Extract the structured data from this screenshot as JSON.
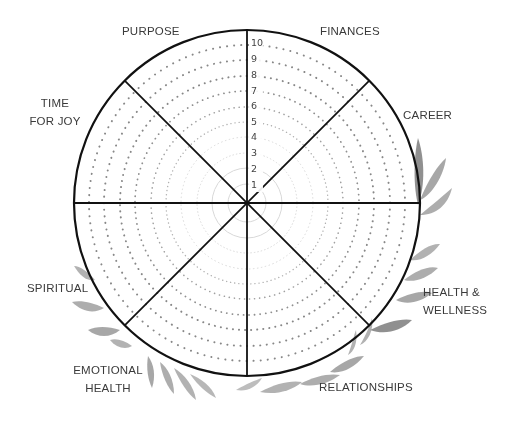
{
  "scale": {
    "min": 1,
    "max": 10,
    "ticks": [
      "1",
      "2",
      "3",
      "4",
      "5",
      "6",
      "7",
      "8",
      "9",
      "10"
    ]
  },
  "categories": [
    {
      "id": "purpose",
      "lines": [
        "PURPOSE"
      ]
    },
    {
      "id": "finances",
      "lines": [
        "FINANCES"
      ]
    },
    {
      "id": "career",
      "lines": [
        "CAREER"
      ]
    },
    {
      "id": "health-wellness",
      "lines": [
        "HEALTH &",
        "WELLNESS"
      ]
    },
    {
      "id": "relationships",
      "lines": [
        "RELATIONSHIPS"
      ]
    },
    {
      "id": "emotional-health",
      "lines": [
        "EMOTIONAL",
        "HEALTH"
      ]
    },
    {
      "id": "spiritual",
      "lines": [
        "SPIRITUAL"
      ]
    },
    {
      "id": "time-for-joy",
      "lines": [
        "TIME",
        "FOR JOY"
      ]
    }
  ],
  "colors": {
    "outline": "#111111",
    "ring_dots_dark": "#8a8a8a",
    "ring_dots_light": "#cfcfcf",
    "label": "#3a3a3a",
    "leaf": "#7d7d7d"
  },
  "decoration": "watercolor-leaves"
}
